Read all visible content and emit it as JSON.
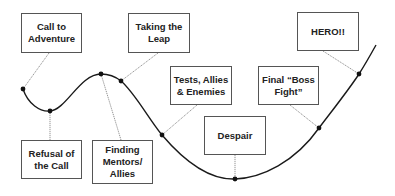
{
  "stages": [
    {
      "id": "call",
      "label": "Call to\nAdventure",
      "box": {
        "x": 21,
        "y": 13,
        "w": 61,
        "h": 40
      },
      "point": {
        "x": 23,
        "y": 89
      },
      "anchor": {
        "x": 49,
        "y": 53
      }
    },
    {
      "id": "refusal",
      "label": "Refusal of\nthe Call",
      "box": {
        "x": 21,
        "y": 140,
        "w": 61,
        "h": 39
      },
      "point": {
        "x": 50,
        "y": 111
      },
      "anchor": {
        "x": 50,
        "y": 140
      }
    },
    {
      "id": "mentors",
      "label": "Finding\nMentors/\nAllies",
      "box": {
        "x": 92,
        "y": 140,
        "w": 61,
        "h": 44
      },
      "point": {
        "x": 101,
        "y": 74
      },
      "anchor": {
        "x": 121,
        "y": 140
      }
    },
    {
      "id": "leap",
      "label": "Taking the\nLeap",
      "box": {
        "x": 128,
        "y": 13,
        "w": 62,
        "h": 40
      },
      "point": {
        "x": 121,
        "y": 81
      },
      "anchor": {
        "x": 158,
        "y": 53
      }
    },
    {
      "id": "tests",
      "label": "Tests, Allies\n& Enemies",
      "box": {
        "x": 170,
        "y": 66,
        "w": 62,
        "h": 39
      },
      "point": {
        "x": 162,
        "y": 135
      },
      "anchor": {
        "x": 197,
        "y": 105
      }
    },
    {
      "id": "despair",
      "label": "Despair",
      "box": {
        "x": 204,
        "y": 116,
        "w": 62,
        "h": 39
      },
      "point": {
        "x": 235,
        "y": 179
      },
      "anchor": {
        "x": 235,
        "y": 155
      }
    },
    {
      "id": "boss",
      "label": "Final “Boss\nFight”",
      "box": {
        "x": 258,
        "y": 66,
        "w": 61,
        "h": 39
      },
      "point": {
        "x": 319,
        "y": 128
      },
      "anchor": {
        "x": 290,
        "y": 105
      }
    },
    {
      "id": "hero",
      "label": "HERO!!",
      "box": {
        "x": 297,
        "y": 12,
        "w": 62,
        "h": 39
      },
      "point": {
        "x": 359,
        "y": 74
      },
      "anchor": {
        "x": 323,
        "y": 51
      }
    }
  ],
  "curve_path": "M23,89 C28,104 40,112 50,111 C66,110 80,74 101,74 C110,74 116,77 121,81 C135,93 148,118 162,135 C185,162 210,180 235,179 C262,178 295,162 319,128 C335,107 350,88 359,74 C366,63 371,54 376,45",
  "colors": {
    "line": "#1a1a1a",
    "leader": "#666666",
    "box_border": "#555555",
    "text": "#222222"
  }
}
